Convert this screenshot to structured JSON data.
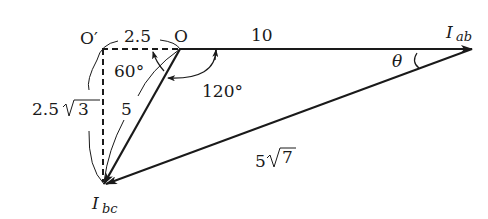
{
  "diagram": {
    "type": "phasor-diagram",
    "points": {
      "origin": {
        "label": "O"
      },
      "origin_prime": {
        "label": "O′"
      },
      "i_ab": {
        "label": "I",
        "subscript": "ab"
      },
      "i_bc": {
        "label": "I",
        "subscript": "bc"
      }
    },
    "lengths": {
      "o_prime_to_o": "2.5",
      "o_to_iab": "10",
      "o_to_ibc": "5",
      "o_prime_to_ibc_prefix": "2.5",
      "o_prime_to_ibc_radicand": "3",
      "ibc_to_iab_prefix": "5",
      "ibc_to_iab_radicand": "7"
    },
    "angles": {
      "at_o_inner": "60°",
      "at_o_outer": "120°",
      "at_iab": "θ"
    }
  }
}
